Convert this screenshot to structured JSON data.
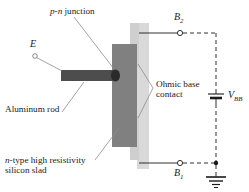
{
  "figure": {
    "kind": "unijunction-transistor-structure-diagram",
    "background": "#ffffff",
    "ink": "#1a1a1a"
  },
  "labels": {
    "pn_junction": "p-n junction",
    "pn_junction_italic_prefix": "p-n",
    "pn_junction_rest": " junction",
    "emitter": "E",
    "aluminum_rod": "Aluminum rod",
    "ohmic_base_line1": "Ohmic base",
    "ohmic_base_line2": "contact",
    "silicon_line1_italic": "n",
    "silicon_line1_rest": "-type high resistivity",
    "silicon_line2": "silicon slad",
    "base2": "B",
    "base2_sub": "2",
    "base1": "B",
    "base1_sub": "1",
    "supply": "V",
    "supply_sub": "BB"
  },
  "colors": {
    "slab_dark": "#808080",
    "slab_strip_light": "#d9d9d9",
    "contact_pad": "#cfcfcf",
    "rod": "#4d4d4d",
    "junction_cap": "#2b2b2b",
    "wire": "#1a1a1a",
    "leader": "#8c8c8c",
    "dashed": "#1a1a1a"
  },
  "components": {
    "silicon_slab": "n-type high resistivity silicon slad",
    "ohmic_contact_top": "upper ohmic base contact pad",
    "ohmic_contact_bottom": "lower ohmic base contact pad",
    "aluminum_rod": "Aluminum rod",
    "pn_junction_cap": "p-n junction",
    "emitter_terminal": "E",
    "base2_terminal": "B2",
    "base1_terminal": "B1",
    "battery": "VBB",
    "ground": "ground"
  }
}
